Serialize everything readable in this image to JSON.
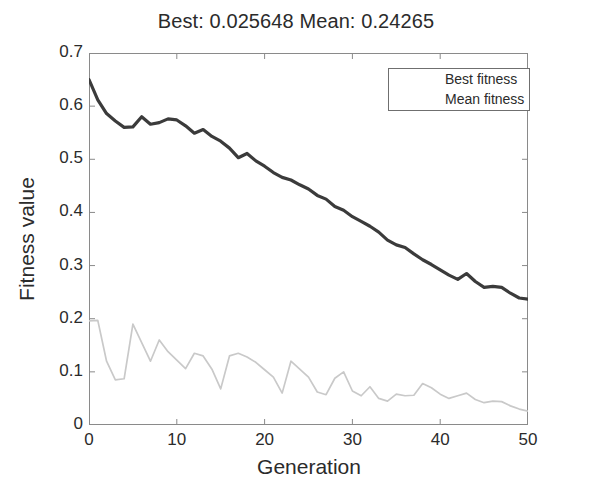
{
  "chart_data": {
    "type": "line",
    "title": "Best: 0.025648 Mean: 0.24265",
    "xlabel": "Generation",
    "ylabel": "Fitness value",
    "xlim": [
      0,
      50
    ],
    "ylim": [
      0,
      0.7
    ],
    "xticks": [
      "0",
      "10",
      "20",
      "30",
      "40",
      "50"
    ],
    "xtick_values": [
      0,
      10,
      20,
      30,
      40,
      50
    ],
    "yticks": [
      "0",
      "0.1",
      "0.2",
      "0.3",
      "0.4",
      "0.5",
      "0.6",
      "0.7"
    ],
    "ytick_values": [
      0,
      0.1,
      0.2,
      0.3,
      0.4,
      0.5,
      0.6,
      0.7
    ],
    "grid": false,
    "legend_position": "top-right-inside",
    "best_fitness_final": 0.025648,
    "mean_fitness_final": 0.24265,
    "x": [
      0,
      1,
      2,
      3,
      4,
      5,
      6,
      7,
      8,
      9,
      10,
      11,
      12,
      13,
      14,
      15,
      16,
      17,
      18,
      19,
      20,
      21,
      22,
      23,
      24,
      25,
      26,
      27,
      28,
      29,
      30,
      31,
      32,
      33,
      34,
      35,
      36,
      37,
      38,
      39,
      40,
      41,
      42,
      43,
      44,
      45,
      46,
      47,
      48,
      49,
      50
    ],
    "series": [
      {
        "name": "Best fitness",
        "color": "#c9c9c9",
        "width": 1.7,
        "values": [
          0.196,
          0.197,
          0.12,
          0.085,
          0.087,
          0.19,
          0.155,
          0.12,
          0.16,
          0.138,
          0.122,
          0.106,
          0.135,
          0.13,
          0.105,
          0.068,
          0.13,
          0.135,
          0.128,
          0.118,
          0.104,
          0.09,
          0.06,
          0.12,
          0.105,
          0.09,
          0.062,
          0.057,
          0.088,
          0.1,
          0.064,
          0.055,
          0.072,
          0.05,
          0.045,
          0.058,
          0.055,
          0.056,
          0.078,
          0.07,
          0.058,
          0.05,
          0.055,
          0.06,
          0.048,
          0.042,
          0.045,
          0.044,
          0.036,
          0.03,
          0.026
        ]
      },
      {
        "name": "Mean fitness",
        "color": "#3b3b3b",
        "width": 3.2,
        "values": [
          0.65,
          0.612,
          0.586,
          0.572,
          0.56,
          0.561,
          0.58,
          0.566,
          0.569,
          0.576,
          0.574,
          0.563,
          0.549,
          0.556,
          0.543,
          0.534,
          0.521,
          0.503,
          0.511,
          0.497,
          0.487,
          0.475,
          0.466,
          0.461,
          0.452,
          0.444,
          0.432,
          0.425,
          0.411,
          0.404,
          0.392,
          0.383,
          0.374,
          0.363,
          0.348,
          0.339,
          0.334,
          0.322,
          0.311,
          0.302,
          0.292,
          0.282,
          0.274,
          0.285,
          0.27,
          0.259,
          0.261,
          0.259,
          0.248,
          0.239,
          0.237
        ]
      }
    ],
    "legend": [
      {
        "label": "Best fitness"
      },
      {
        "label": "Mean fitness"
      }
    ]
  }
}
